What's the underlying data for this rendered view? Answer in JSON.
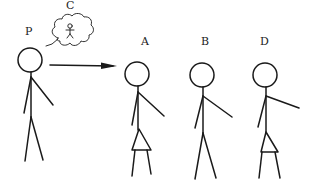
{
  "diagram": {
    "title": "",
    "ink_color": "#1a1a1a",
    "background": "#ffffff",
    "figures": [
      {
        "id": "P",
        "label": "P",
        "role": "thinker",
        "skirt": false,
        "pose": "arm-out-right"
      },
      {
        "id": "A",
        "label": "A",
        "role": "target",
        "skirt": true,
        "pose": "arm-out-right"
      },
      {
        "id": "B",
        "label": "B",
        "role": "candidate",
        "skirt": false,
        "pose": "arm-out-right"
      },
      {
        "id": "D",
        "label": "D",
        "role": "candidate",
        "skirt": true,
        "pose": "arm-out-right"
      }
    ],
    "thought_bubble": {
      "label": "C",
      "owner": "P",
      "contents": "small stick figure"
    },
    "arrow": {
      "from": "P",
      "to": "A",
      "style": "solid with filled arrowhead"
    }
  }
}
